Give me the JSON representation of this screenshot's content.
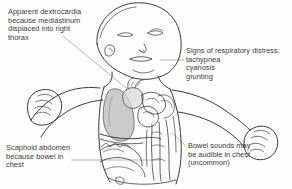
{
  "figure": {
    "background_color": "#fdfdfd",
    "line_color": "#3b3b3b",
    "shade_color": "#b9b9b9",
    "text_color": "#3a3a3a"
  },
  "labels": {
    "dextrocardia": "Apparent dextrocardia\nbecause mediastinum\ndisplaced into right\nthorax",
    "respiratory": "Signs of respiratory distress:\ntachypnea\ncyanosis\ngrunting",
    "scaphoid": "Scaphoid abdomen\nbecause bowel in\nchest",
    "bowel": "Bowel sounds may\nbe audible in chest\n(uncommon)"
  },
  "anatomy": {
    "head": "infant-head",
    "face": "closed-eyes-nose-mouth",
    "left_arm": "left-arm-with-clenched-fist",
    "right_arm": "right-arm-with-clenched-fist",
    "torso": "torso-outline",
    "lung": "shaded-left-lung",
    "heart": "displaced-heart",
    "bowel_loops": "bowel-loops-in-chest",
    "diaphragm": "diaphragm-line",
    "abdomen": "scaphoid-abdomen"
  }
}
